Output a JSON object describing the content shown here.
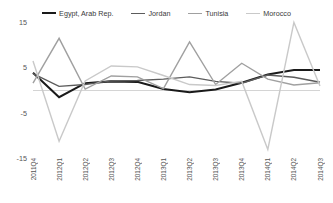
{
  "chart_data": {
    "type": "line",
    "title": "",
    "xlabel": "",
    "ylabel": "",
    "ylim": [
      -15,
      15
    ],
    "yticks": [
      15,
      5,
      -5,
      -15
    ],
    "grid": "zero-line-only",
    "legend_position": "top-center",
    "categories": [
      "2011Q4",
      "2012Q1",
      "2012Q2",
      "2012Q3",
      "2012Q4",
      "2013Q1",
      "2013Q2",
      "2013Q3",
      "2013Q4",
      "2014Q1",
      "2014Q2",
      "2014Q3"
    ],
    "series": [
      {
        "name": "Egypt, Arab Rep.",
        "color": "#1a1a1a",
        "width": 2.1,
        "values": [
          3.8,
          -1.6,
          1.5,
          1.9,
          1.8,
          0.2,
          -0.5,
          0.1,
          1.6,
          3.4,
          4.4,
          4.4
        ]
      },
      {
        "name": "Jordan",
        "color": "#5c5c5c",
        "width": 1.4,
        "values": [
          3.6,
          0.8,
          1.2,
          2.0,
          2.1,
          2.4,
          2.9,
          1.9,
          1.5,
          3.3,
          2.8,
          1.7
        ]
      },
      {
        "name": "Tunisia",
        "color": "#a0a0a0",
        "width": 1.4,
        "values": [
          1.5,
          11.4,
          0.2,
          3.1,
          2.9,
          0.3,
          10.6,
          1.2,
          5.9,
          2.4,
          1.1,
          1.6
        ]
      },
      {
        "name": "Morocco",
        "color": "#c9c9c9",
        "width": 1.4,
        "values": [
          6.4,
          -11.3,
          2.0,
          5.3,
          5.1,
          3.2,
          1.2,
          1.0,
          1.9,
          -13.1,
          14.9,
          0.9
        ]
      }
    ]
  }
}
